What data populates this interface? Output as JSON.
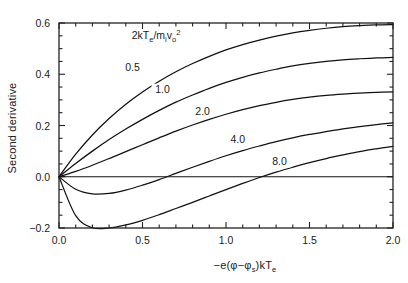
{
  "chart_data": {
    "type": "line",
    "title": "",
    "annotation": "2kTe/mivo2",
    "annotation_parts": {
      "lead": "2kT",
      "sub1": "e",
      "slash": "/m",
      "sub2": "i",
      "v": "v",
      "sub3": "o",
      "sup": "2"
    },
    "xlabel": "-e(φ-φs)kTe",
    "xlabel_parts": {
      "lead": "−e(φ−φ",
      "sub1": "s",
      "mid": ")kT",
      "sub2": "e"
    },
    "ylabel": "Second derivative",
    "xlim": [
      0.0,
      2.0
    ],
    "ylim": [
      -0.2,
      0.6
    ],
    "xticks": [
      0.0,
      0.5,
      1.0,
      1.5,
      2.0
    ],
    "xtick_labels": [
      "0.0",
      "0.5",
      "1.0",
      "1.5",
      "2.0"
    ],
    "yticks": [
      -0.2,
      0.0,
      0.2,
      0.4,
      0.6
    ],
    "ytick_labels": [
      "-0.2",
      "0.0",
      "0.2",
      "0.4",
      "0.6"
    ],
    "x_minor_step": 0.1,
    "y_minor_step": 0.05,
    "grid": false,
    "legend_position": "inline-curve-labels",
    "zero_reference_line": true,
    "x": [
      0.0,
      0.1,
      0.2,
      0.3,
      0.4,
      0.5,
      0.6,
      0.7,
      0.8,
      0.9,
      1.0,
      1.1,
      1.2,
      1.3,
      1.4,
      1.5,
      1.6,
      1.7,
      1.8,
      1.9,
      2.0
    ],
    "series": [
      {
        "name": "0.5",
        "label": "0.5",
        "label_x": 0.44,
        "label_y": 0.418,
        "values": [
          0.0,
          0.088,
          0.163,
          0.227,
          0.283,
          0.331,
          0.373,
          0.41,
          0.442,
          0.47,
          0.495,
          0.516,
          0.5335,
          0.5485,
          0.5615,
          0.5715,
          0.5795,
          0.5855,
          0.5895,
          0.5925,
          0.594
        ]
      },
      {
        "name": "1.0",
        "label": "1.0",
        "label_x": 0.62,
        "label_y": 0.332,
        "values": [
          0.0,
          0.052,
          0.1,
          0.145,
          0.186,
          0.224,
          0.259,
          0.291,
          0.319,
          0.345,
          0.368,
          0.388,
          0.405,
          0.4195,
          0.4325,
          0.4425,
          0.4505,
          0.4565,
          0.4605,
          0.4635,
          0.4655
        ]
      },
      {
        "name": "2.0",
        "label": "2.0",
        "label_x": 0.86,
        "label_y": 0.248,
        "values": [
          0.0,
          0.021,
          0.045,
          0.071,
          0.098,
          0.125,
          0.152,
          0.178,
          0.202,
          0.224,
          0.244,
          0.262,
          0.2775,
          0.2905,
          0.3015,
          0.3105,
          0.3175,
          0.3225,
          0.3265,
          0.3295,
          0.3315
        ]
      },
      {
        "name": "4.0",
        "label": "4.0",
        "label_x": 1.07,
        "label_y": 0.136,
        "values": [
          0.0,
          -0.049,
          -0.067,
          -0.065,
          -0.052,
          -0.033,
          -0.011,
          0.013,
          0.037,
          0.06,
          0.082,
          0.102,
          0.12,
          0.137,
          0.152,
          0.165,
          0.176,
          0.1865,
          0.1955,
          0.2035,
          0.2105
        ]
      },
      {
        "name": "8.0",
        "label": "8.0",
        "label_x": 1.32,
        "label_y": 0.052,
        "values": [
          0.0,
          -0.152,
          -0.199,
          -0.2,
          -0.188,
          -0.17,
          -0.148,
          -0.124,
          -0.1,
          -0.075,
          -0.05,
          -0.026,
          -0.003,
          0.018,
          0.037,
          0.055,
          0.071,
          0.085,
          0.098,
          0.109,
          0.119
        ]
      }
    ]
  },
  "figure": {
    "name": "second-derivative-plot"
  }
}
